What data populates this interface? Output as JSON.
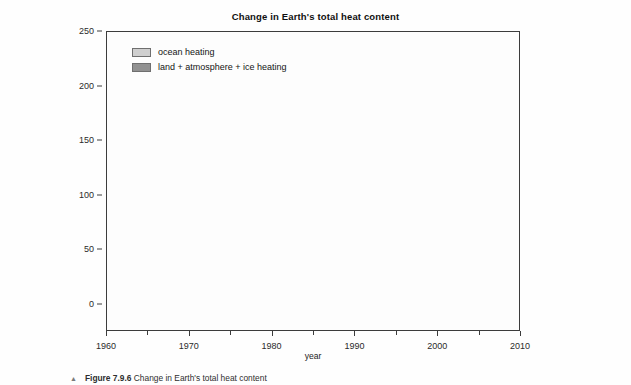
{
  "figure": {
    "title": "Change in Earth's total heat content",
    "caption_bullet": "▲",
    "caption_label": "Figure 7.9.6",
    "caption_text": "Change in Earth's total heat content"
  },
  "legend": {
    "position": "top-left",
    "items": [
      {
        "label": "ocean heating",
        "color": "#cfcfcf",
        "border": "#6f6f6f"
      },
      {
        "label": "land + atmosphere + ice heating",
        "color": "#919191",
        "border": "#6f6f6f"
      }
    ]
  },
  "axes": {
    "x": {
      "label": "year",
      "min": 1960,
      "max": 2010,
      "major_ticks": [
        1960,
        1970,
        1980,
        1990,
        2000,
        2010
      ],
      "minor_ticks": [
        1965,
        1975,
        1985,
        1995,
        2005
      ],
      "tick_labels": [
        "1960",
        "1970",
        "1980",
        "1990",
        "2000",
        "2010"
      ]
    },
    "y": {
      "label": "change in total heat content since 1961 [10",
      "label_sup": "21",
      "label_tail": " Joules]",
      "min": -25,
      "max": 250,
      "major_ticks": [
        0,
        50,
        100,
        150,
        200,
        250
      ],
      "tick_labels": [
        "0",
        "50",
        "100",
        "150",
        "200",
        "250"
      ],
      "grid": true
    }
  },
  "style": {
    "ocean_fill": "#cfcfcf",
    "land_fill": "#919191",
    "line_color": "#5a5a5a",
    "frame_color": "#3c3c3c",
    "grid_color": "#e2e2e2",
    "plot_bg": "#fdfdfd",
    "page_bg": "#fefefe"
  },
  "chart_data": {
    "type": "area",
    "stacked": true,
    "title": "Change in Earth's total heat content",
    "xlabel": "year",
    "ylabel": "change in total heat content since 1961 [10^21 Joules]",
    "xlim": [
      1960,
      2010
    ],
    "ylim": [
      -25,
      250
    ],
    "grid": true,
    "legend_position": "top-left",
    "x": [
      1962,
      1963,
      1964,
      1965,
      1966,
      1967,
      1968,
      1969,
      1970,
      1971,
      1972,
      1973,
      1974,
      1975,
      1976,
      1977,
      1978,
      1979,
      1980,
      1981,
      1982,
      1983,
      1984,
      1985,
      1986,
      1987,
      1988,
      1989,
      1990,
      1991,
      1992,
      1993,
      1994,
      1995,
      1996,
      1997,
      1998,
      1999,
      2000,
      2001,
      2002,
      2003,
      2004,
      2005,
      2006,
      2007,
      2008
    ],
    "series": [
      {
        "name": "land + atmosphere + ice heating",
        "values": [
          0.3,
          0.4,
          0.2,
          0.0,
          -0.2,
          0.0,
          0.3,
          0.5,
          0.4,
          0.3,
          1.0,
          2.0,
          2.6,
          2.8,
          2.5,
          2.4,
          2.6,
          2.8,
          3.2,
          3.6,
          3.9,
          4.3,
          4.7,
          5.0,
          5.4,
          6.0,
          6.6,
          7.0,
          7.6,
          8.1,
          8.4,
          8.8,
          9.3,
          9.8,
          10.2,
          10.6,
          11.2,
          11.0,
          11.4,
          11.9,
          12.4,
          13.0,
          13.6,
          14.2,
          14.8,
          15.4,
          16.2
        ]
      },
      {
        "name": "ocean heating",
        "values": [
          0.0,
          1.0,
          -1.0,
          -8.0,
          2.0,
          12.0,
          17.0,
          6.0,
          -10.0,
          -2.0,
          8.0,
          18.0,
          24.0,
          22.0,
          21.0,
          26.0,
          30.0,
          46.0,
          58.0,
          66.0,
          74.0,
          85.0,
          80.0,
          80.0,
          82.0,
          95.0,
          110.0,
          118.0,
          131.0,
          141.0,
          134.0,
          140.0,
          150.0,
          160.0,
          170.0,
          180.0,
          168.0,
          150.0,
          163.0,
          180.0,
          186.0,
          190.0,
          196.0,
          200.0,
          205.0,
          212.0,
          216.0
        ]
      }
    ],
    "total_2008": 232,
    "note": "Stacked area: land+atmosphere+ice is the lower band; ocean heating is stacked on top. Total reaches about 232 x 10^21 Joules by 2008."
  }
}
